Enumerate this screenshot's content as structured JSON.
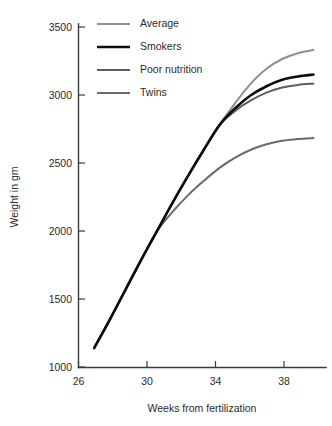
{
  "chart_data": {
    "type": "line",
    "title": "",
    "subtitle": "",
    "xlabel": "Weeks from fertilization",
    "ylabel": "Weight in gm",
    "xlim": [
      25.0,
      40.8
    ],
    "ylim": [
      950,
      3600
    ],
    "xticks": [
      26,
      30,
      34,
      38
    ],
    "xtick_labels": [
      "26",
      "30",
      "34",
      "38"
    ],
    "yticks": [
      1000,
      1500,
      2000,
      2500,
      3000,
      3500
    ],
    "ytick_labels": [
      "1000",
      "1500",
      "2000",
      "2500",
      "3000",
      "3500"
    ],
    "grid": false,
    "legend_position": "upper-left-inside",
    "legend_frame": false,
    "x": [
      26,
      27,
      28,
      29,
      30,
      31,
      32,
      33,
      34,
      35,
      36,
      37,
      38,
      39,
      40
    ],
    "series": [
      {
        "name": "Average",
        "color": "#8f8f8f",
        "line_width": 2.0,
        "values": [
          1100,
          1320,
          1550,
          1780,
          2000,
          2220,
          2430,
          2630,
          2820,
          2990,
          3140,
          3255,
          3330,
          3375,
          3400
        ]
      },
      {
        "name": "Smokers",
        "color": "#0d0d0d",
        "line_width": 2.6,
        "values": [
          1100,
          1320,
          1550,
          1780,
          2000,
          2220,
          2430,
          2630,
          2820,
          2950,
          3050,
          3120,
          3170,
          3195,
          3210
        ]
      },
      {
        "name": "Poor nutrition",
        "color": "#5e5e5e",
        "line_width": 2.0,
        "values": [
          1100,
          1320,
          1550,
          1780,
          2000,
          2220,
          2430,
          2630,
          2820,
          2930,
          3010,
          3070,
          3110,
          3130,
          3140
        ]
      },
      {
        "name": "Twins",
        "color": "#6a6a6a",
        "line_width": 2.0,
        "values": [
          1100,
          1320,
          1550,
          1780,
          2000,
          2150,
          2280,
          2390,
          2490,
          2570,
          2630,
          2672,
          2700,
          2712,
          2720
        ]
      }
    ]
  },
  "legend": {
    "items": [
      {
        "label": "Average"
      },
      {
        "label": "Smokers"
      },
      {
        "label": "Poor nutrition"
      },
      {
        "label": "Twins"
      }
    ]
  },
  "axes": {
    "y_axis_title": "Weight in gm",
    "x_axis_title": "Weeks from fertilization"
  }
}
